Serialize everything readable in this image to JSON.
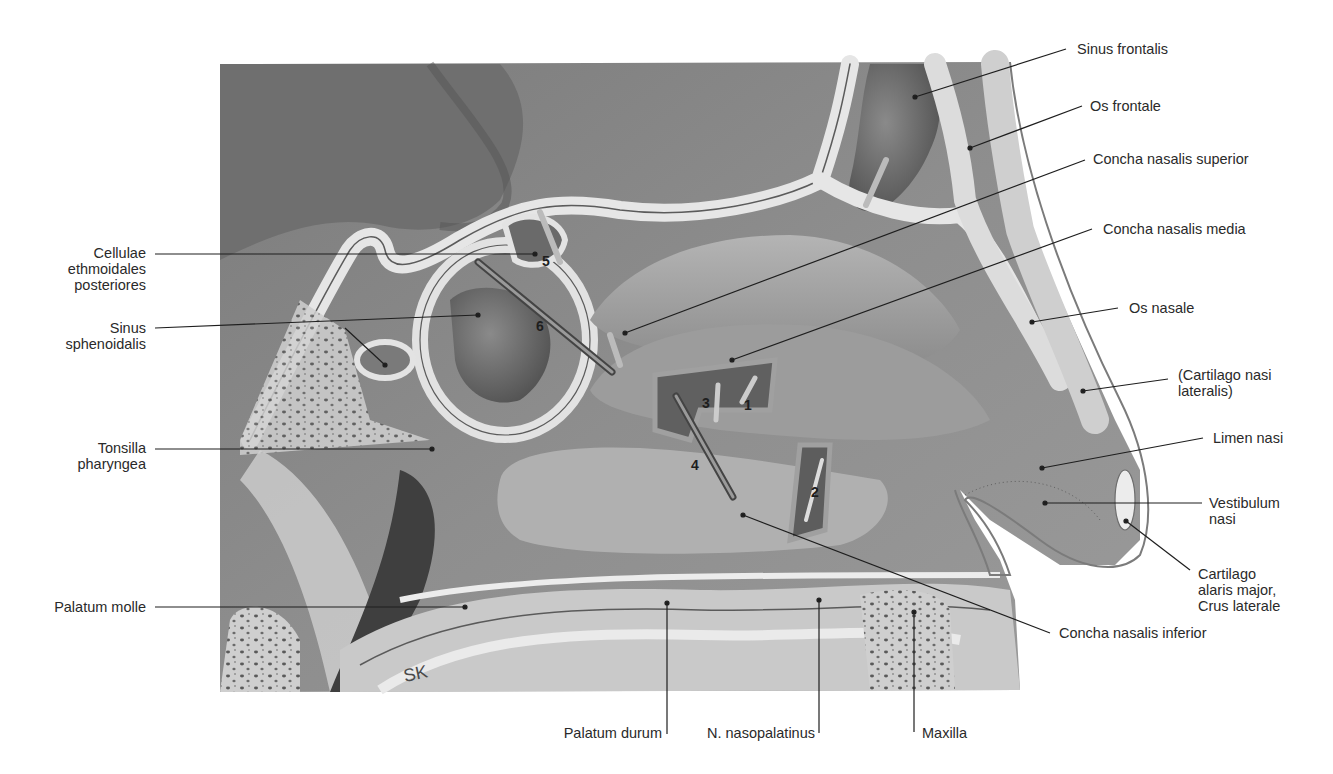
{
  "figure": {
    "signature": "SK",
    "colors": {
      "background": "#ffffff",
      "tissue_dark": "#6d6d6d",
      "tissue_mid": "#8c8c8c",
      "tissue_light": "#a9a9a9",
      "bone": "#d9d9d9",
      "leader_line": "#1e1e1e",
      "label_text": "#2a2a2a"
    }
  },
  "labels": {
    "left": [
      {
        "id": "cellulae",
        "text": "Cellulae\nethmoidales\nposteriores"
      },
      {
        "id": "sinus_sphenoidalis",
        "text": "Sinus\nsphenoidalis"
      },
      {
        "id": "tonsilla",
        "text": "Tonsilla\npharyngea"
      },
      {
        "id": "palatum_molle",
        "text": "Palatum molle"
      }
    ],
    "right": [
      {
        "id": "sinus_frontalis",
        "text": "Sinus frontalis"
      },
      {
        "id": "os_frontale",
        "text": "Os frontale"
      },
      {
        "id": "concha_superior",
        "text": "Concha nasalis superior"
      },
      {
        "id": "concha_media",
        "text": "Concha nasalis media"
      },
      {
        "id": "os_nasale",
        "text": "Os nasale"
      },
      {
        "id": "cartilago_lateralis",
        "text": "(Cartilago nasi\nlateralis)"
      },
      {
        "id": "limen_nasi",
        "text": "Limen nasi"
      },
      {
        "id": "vestibulum",
        "text": "Vestibulum\nnasi"
      },
      {
        "id": "cartilago_alaris",
        "text": "Cartilago\nalaris major,\nCrus laterale"
      },
      {
        "id": "concha_inferior",
        "text": "Concha nasalis inferior"
      }
    ],
    "bottom": [
      {
        "id": "palatum_durum",
        "text": "Palatum durum"
      },
      {
        "id": "n_nasopalatinus",
        "text": "N. nasopalatinus"
      },
      {
        "id": "maxilla",
        "text": "Maxilla"
      }
    ]
  },
  "probe_numbers": [
    "1",
    "2",
    "3",
    "4",
    "5",
    "6"
  ]
}
